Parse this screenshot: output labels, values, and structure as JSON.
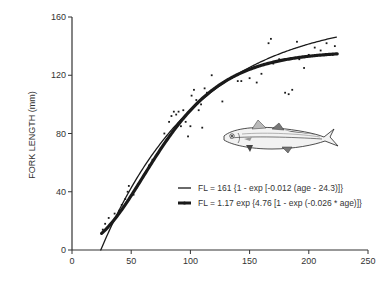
{
  "chart_data": {
    "type": "scatter",
    "title": "",
    "xlabel": "",
    "ylabel": "FORK LENGTH (mm)",
    "xlim": [
      0,
      250
    ],
    "ylim": [
      0,
      160
    ],
    "x_ticks": [
      0,
      50,
      100,
      150,
      200,
      250
    ],
    "y_ticks": [
      0,
      40,
      80,
      120,
      160
    ],
    "grid": false,
    "legend_position": "lower right",
    "series": [
      {
        "name": "FL = 161 {1 - exp [-0.012 (age - 24.3)]}",
        "kind": "line",
        "model": "von_bertalanffy",
        "params": {
          "Linf": 161,
          "k": 0.012,
          "t0": 24.3
        },
        "x_range": [
          24.3,
          224
        ],
        "line_width": 1.3
      },
      {
        "name": "FL = 1.17 exp {4.76 [1 - exp (-0.026 * age)]}",
        "kind": "line",
        "model": "gompertz",
        "params": {
          "a": 1.17,
          "b": 4.76,
          "g": 0.026
        },
        "x_range": [
          25,
          224
        ],
        "line_width": 3.2
      },
      {
        "name": "observations",
        "kind": "scatter",
        "points": [
          [
            26,
            14
          ],
          [
            28,
            18
          ],
          [
            31,
            22
          ],
          [
            33,
            17
          ],
          [
            36,
            25
          ],
          [
            40,
            27
          ],
          [
            42,
            31
          ],
          [
            45,
            35
          ],
          [
            47,
            40
          ],
          [
            48,
            44
          ],
          [
            52,
            38
          ],
          [
            55,
            43
          ],
          [
            60,
            50
          ],
          [
            65,
            58
          ],
          [
            68,
            62
          ],
          [
            72,
            66
          ],
          [
            75,
            70
          ],
          [
            78,
            80
          ],
          [
            80,
            76
          ],
          [
            82,
            88
          ],
          [
            84,
            92
          ],
          [
            86,
            95
          ],
          [
            88,
            93
          ],
          [
            90,
            95
          ],
          [
            92,
            85
          ],
          [
            94,
            96
          ],
          [
            96,
            88
          ],
          [
            98,
            78
          ],
          [
            100,
            85
          ],
          [
            101,
            106
          ],
          [
            103,
            110
          ],
          [
            105,
            103
          ],
          [
            107,
            96
          ],
          [
            109,
            100
          ],
          [
            110,
            84
          ],
          [
            112,
            111
          ],
          [
            114,
            108
          ],
          [
            118,
            120
          ],
          [
            122,
            112
          ],
          [
            127,
            102
          ],
          [
            135,
            118
          ],
          [
            140,
            116
          ],
          [
            143,
            116
          ],
          [
            150,
            118
          ],
          [
            156,
            115
          ],
          [
            160,
            121
          ],
          [
            166,
            142
          ],
          [
            168,
            145
          ],
          [
            170,
            128
          ],
          [
            175,
            131
          ],
          [
            180,
            108
          ],
          [
            183,
            107
          ],
          [
            186,
            110
          ],
          [
            190,
            143
          ],
          [
            192,
            131
          ],
          [
            196,
            125
          ],
          [
            200,
            134
          ],
          [
            205,
            139
          ],
          [
            210,
            137
          ],
          [
            215,
            142
          ],
          [
            220,
            134
          ],
          [
            222,
            140
          ]
        ]
      }
    ],
    "annotations": [
      "fish illustration (jack mackerel)"
    ]
  },
  "labels": {
    "ylabel": "FORK LENGTH (mm)",
    "legend": [
      "FL = 161 {1 - exp [-0.012 (age - 24.3)]}",
      "FL = 1.17 exp {4.76 [1 - exp (-0.026 * age)]}"
    ]
  },
  "colors": {
    "ink": "#1a1a1a",
    "axis": "#333333",
    "text": "#333333",
    "background": "#ffffff"
  }
}
